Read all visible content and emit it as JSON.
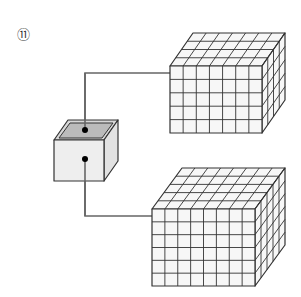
{
  "figure": {
    "label": "⑪",
    "colors": {
      "stroke": "#333333",
      "wire": "#666666",
      "box_face": "#eeeeee",
      "box_inner": "#bbbbbb",
      "grid_face": "#f7f7f7",
      "dot": "#000000"
    },
    "small_box": {
      "front": [
        54,
        140,
        104,
        181
      ],
      "depth": [
        14,
        -20
      ]
    },
    "upper_cube": {
      "front": [
        170,
        66,
        262,
        133
      ],
      "cols": 7,
      "rows": 5,
      "depth_rows": 4,
      "depth": [
        23,
        -33
      ]
    },
    "lower_cube": {
      "front": [
        152,
        209,
        255,
        286
      ],
      "cols": 8,
      "rows": 6,
      "depth_rows": 5,
      "depth": [
        30,
        -41
      ]
    },
    "wires": [
      {
        "points": [
          [
            85,
            130
          ],
          [
            85,
            73
          ],
          [
            170,
            73
          ]
        ]
      },
      {
        "points": [
          [
            85,
            159
          ],
          [
            85,
            216
          ],
          [
            152,
            216
          ]
        ]
      }
    ]
  }
}
